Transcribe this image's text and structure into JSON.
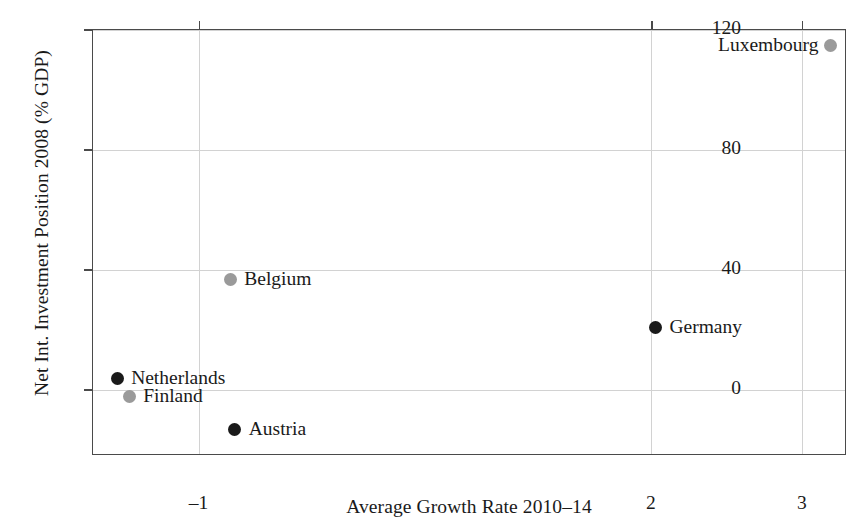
{
  "chart_data": {
    "type": "scatter",
    "title": "",
    "xlabel": "Average Growth Rate 2010–14",
    "ylabel": "Net Int. Investment Position 2008 (% GDP)",
    "xlim": [
      -1.7,
      3.3
    ],
    "ylim": [
      -22,
      120
    ],
    "xticks": [
      -1,
      2,
      3
    ],
    "xtick_labels": [
      "–1",
      "2",
      "3"
    ],
    "yticks": [
      0,
      40,
      80,
      120
    ],
    "ytick_labels": [
      "0",
      "40",
      "80",
      "120"
    ],
    "grid": true,
    "legend": "none",
    "colors": {
      "dark_marker": "#1a1a1a",
      "light_marker": "#9a9a9a",
      "gridline": "#d2d2d2",
      "axis": "#4a4a4a",
      "background": "#ffffff"
    },
    "points": [
      {
        "label": "Luxembourg",
        "x": 3.19,
        "y": 115,
        "color": "#9a9a9a",
        "label_side": "left"
      },
      {
        "label": "Belgium",
        "x": -0.79,
        "y": 37,
        "color": "#9a9a9a",
        "label_side": "right"
      },
      {
        "label": "Germany",
        "x": 2.03,
        "y": 21,
        "color": "#1a1a1a",
        "label_side": "right"
      },
      {
        "label": "Netherlands",
        "x": -1.54,
        "y": 4,
        "color": "#1a1a1a",
        "label_side": "right"
      },
      {
        "label": "Finland",
        "x": -1.46,
        "y": -2,
        "color": "#9a9a9a",
        "label_side": "right"
      },
      {
        "label": "Austria",
        "x": -0.76,
        "y": -13,
        "color": "#1a1a1a",
        "label_side": "right"
      }
    ]
  }
}
